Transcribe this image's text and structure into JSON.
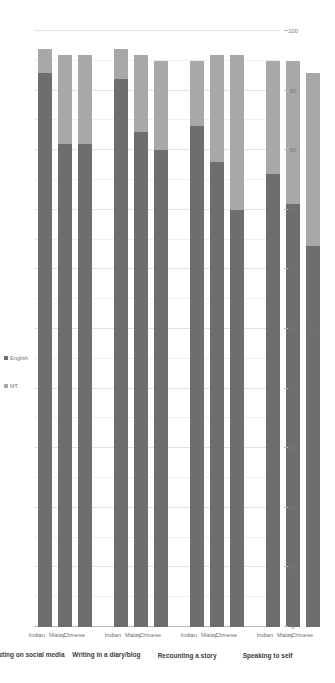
{
  "chart_data": {
    "type": "bar",
    "subtype": "stacked-horizontal",
    "title": "",
    "xlabel": "%",
    "ylabel": "",
    "xlim": [
      0,
      100
    ],
    "xticks": [
      "0",
      "10",
      "20",
      "30",
      "40",
      "50",
      "60",
      "70",
      "80",
      "90",
      "100"
    ],
    "grid": true,
    "legend_position": "top",
    "orientation": "page-rotated-90",
    "legend": [
      "MT",
      "English"
    ],
    "series": [
      {
        "name": "English",
        "color": "#6e6e6e",
        "values": [
          64,
          71,
          76,
          70,
          78,
          84,
          80,
          83,
          92,
          81,
          81,
          93
        ]
      },
      {
        "name": "MT",
        "color": "#a8a8a8",
        "values": [
          29,
          24,
          19,
          26,
          18,
          11,
          15,
          13,
          5,
          15,
          15,
          4
        ]
      }
    ],
    "categories": [
      "Chinese",
      "Malay",
      "Indian",
      "Chinese",
      "Malay",
      "Indian",
      "Chinese",
      "Malay",
      "Indian",
      "Chinese",
      "Malay",
      "Indian"
    ],
    "groups": [
      {
        "label": "Speaking to self",
        "categories": [
          "Chinese",
          "Malay",
          "Indian"
        ],
        "english": [
          64,
          71,
          76
        ],
        "mt": [
          29,
          24,
          19
        ]
      },
      {
        "label": "Recounting a story",
        "categories": [
          "Chinese",
          "Malay",
          "Indian"
        ],
        "english": [
          70,
          78,
          84
        ],
        "mt": [
          26,
          18,
          11
        ]
      },
      {
        "label": "Writing in a diary/blog",
        "categories": [
          "Chinese",
          "Malay",
          "Indian"
        ],
        "english": [
          80,
          83,
          92
        ],
        "mt": [
          15,
          13,
          5
        ]
      },
      {
        "label": "Posting on social media",
        "categories": [
          "Chinese",
          "Malay",
          "Indian"
        ],
        "english": [
          81,
          81,
          93
        ],
        "mt": [
          15,
          15,
          4
        ]
      }
    ]
  },
  "legend": {
    "mt_label": "MT",
    "english_label": "English"
  },
  "axis": {
    "value_title": "%"
  }
}
